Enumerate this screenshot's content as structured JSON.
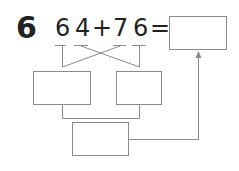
{
  "problem": {
    "number": "6",
    "expression": {
      "addend1_tens": "6",
      "addend1_ones": "4",
      "operator": "+",
      "addend2_tens": "7",
      "addend2_ones": "6",
      "equals": "="
    },
    "answer_box": "",
    "tens_sum_box": "",
    "ones_sum_box": "",
    "total_box": ""
  },
  "colors": {
    "line": "#8a8a8a",
    "text": "#222222"
  }
}
